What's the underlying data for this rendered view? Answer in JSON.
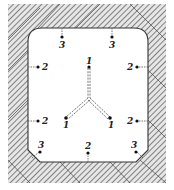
{
  "diagram": {
    "type": "cross-section",
    "colors": {
      "hatch": "#555555",
      "wall_bg": "#d9d9d9",
      "interior": "#ffffff",
      "ink": "#222222"
    },
    "points": [
      {
        "id": "p-top-left-3",
        "label": "3",
        "x": 62,
        "y": 37,
        "lx": 60,
        "ly": 47
      },
      {
        "id": "p-top-right-3",
        "label": "3",
        "x": 112,
        "y": 37,
        "lx": 110,
        "ly": 47
      },
      {
        "id": "p-left-upper-2",
        "label": "2",
        "x": 38,
        "y": 67,
        "lx": 43,
        "ly": 71
      },
      {
        "id": "p-right-upper-2",
        "label": "2",
        "x": 136,
        "y": 67,
        "lx": 127,
        "ly": 71
      },
      {
        "id": "p-center-top-1",
        "label": "1",
        "x": 89,
        "y": 67,
        "lx": 87,
        "ly": 64
      },
      {
        "id": "p-left-lower-2",
        "label": "2",
        "x": 38,
        "y": 121,
        "lx": 43,
        "ly": 125
      },
      {
        "id": "p-right-lower-2",
        "label": "2",
        "x": 136,
        "y": 121,
        "lx": 127,
        "ly": 125
      },
      {
        "id": "p-center-left-1",
        "label": "1",
        "x": 66,
        "y": 117,
        "lx": 63,
        "ly": 127
      },
      {
        "id": "p-center-right-1",
        "label": "1",
        "x": 110,
        "y": 117,
        "lx": 108,
        "ly": 127
      },
      {
        "id": "p-bottom-left-3",
        "label": "3",
        "x": 40,
        "y": 152,
        "lx": 40,
        "ly": 147
      },
      {
        "id": "p-bottom-center-2",
        "label": "2",
        "x": 88,
        "y": 152,
        "lx": 86,
        "ly": 148
      },
      {
        "id": "p-bottom-right-3",
        "label": "3",
        "x": 136,
        "y": 152,
        "lx": 132,
        "ly": 148
      }
    ],
    "labels": {
      "p1a": "1",
      "p1b": "1",
      "p1c": "1",
      "p2a": "2",
      "p2b": "2",
      "p2c": "2",
      "p2d": "2",
      "p2e": "2",
      "p3a": "3",
      "p3b": "3",
      "p3c": "3",
      "p3d": "3"
    }
  }
}
